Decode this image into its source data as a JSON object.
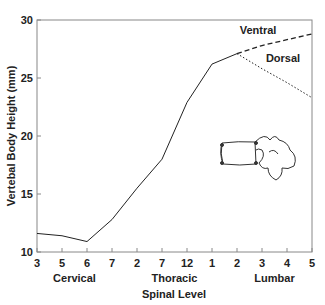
{
  "chart_data": {
    "type": "line",
    "title": "",
    "xlabel": "Spinal Level",
    "ylabel": "Vertebal Body Height (mm)",
    "ylim": [
      10,
      30
    ],
    "yticks": [
      10,
      15,
      20,
      25,
      30
    ],
    "categories": [
      "3",
      "5",
      "6",
      "7",
      "2",
      "7",
      "12",
      "1",
      "2",
      "3",
      "4",
      "5"
    ],
    "groups": [
      {
        "label": "Cervical",
        "from": 0,
        "to": 3
      },
      {
        "label": "Thoracic",
        "from": 4,
        "to": 7
      },
      {
        "label": "Lumbar",
        "from": 8,
        "to": 11
      }
    ],
    "series": [
      {
        "name": "Combined",
        "style": "solid",
        "values": [
          11.6,
          11.4,
          10.9,
          12.8,
          15.5,
          18.0,
          22.9,
          26.2,
          27.1,
          null,
          null,
          null
        ]
      },
      {
        "name": "Ventral",
        "style": "dashed",
        "values": [
          null,
          null,
          null,
          null,
          null,
          null,
          null,
          null,
          27.1,
          27.8,
          28.3,
          28.8
        ]
      },
      {
        "name": "Dorsal",
        "style": "dotted",
        "values": [
          null,
          null,
          null,
          null,
          null,
          null,
          null,
          null,
          27.1,
          25.8,
          24.6,
          23.3
        ]
      }
    ],
    "annotations": [
      "Ventral",
      "Dorsal"
    ],
    "grid": false,
    "legend": "inline labels"
  }
}
